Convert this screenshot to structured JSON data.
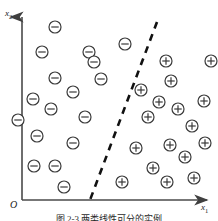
{
  "figure": {
    "caption": "图 2-3  两类线性可分的实例",
    "origin_label": "O",
    "axes": {
      "y_label_base": "x",
      "y_label_sub": "2",
      "x_label_base": "x",
      "x_label_sub": "1",
      "x_axis_color": "#4a4a4a",
      "y_axis_color": "#4a4a4a"
    },
    "colors": {
      "marker_stroke": "#3a3a3a",
      "boundary": "#111111",
      "background": "#ffffff"
    }
  },
  "chart_data": {
    "type": "scatter",
    "title": "图 2-3  两类线性可分的实例",
    "xlabel": "x1",
    "ylabel": "x2",
    "xlim": [
      0,
      218
    ],
    "ylim": [
      0,
      221
    ],
    "grid": false,
    "legend": null,
    "marker_radius": 6,
    "series": [
      {
        "name": "negative-class",
        "symbol": "minus-circle",
        "glyph": "⊖",
        "count": 17,
        "points": [
          {
            "x": 55,
            "y": 27
          },
          {
            "x": 42,
            "y": 52
          },
          {
            "x": 89,
            "y": 52
          },
          {
            "x": 125,
            "y": 44
          },
          {
            "x": 55,
            "y": 78
          },
          {
            "x": 101,
            "y": 79
          },
          {
            "x": 73,
            "y": 92
          },
          {
            "x": 33,
            "y": 99
          },
          {
            "x": 51,
            "y": 109
          },
          {
            "x": 85,
            "y": 117
          },
          {
            "x": 37,
            "y": 136
          },
          {
            "x": 73,
            "y": 143
          },
          {
            "x": 34,
            "y": 166
          },
          {
            "x": 55,
            "y": 166
          },
          {
            "x": 64,
            "y": 187
          },
          {
            "x": 18,
            "y": 120
          },
          {
            "x": 94,
            "y": 62
          }
        ]
      },
      {
        "name": "positive-class",
        "symbol": "plus-circle",
        "glyph": "⊕",
        "count": 21,
        "points": [
          {
            "x": 166,
            "y": 61
          },
          {
            "x": 171,
            "y": 81
          },
          {
            "x": 159,
            "y": 102
          },
          {
            "x": 178,
            "y": 109
          },
          {
            "x": 204,
            "y": 101
          },
          {
            "x": 148,
            "y": 117
          },
          {
            "x": 192,
            "y": 126
          },
          {
            "x": 136,
            "y": 148
          },
          {
            "x": 170,
            "y": 145
          },
          {
            "x": 205,
            "y": 143
          },
          {
            "x": 185,
            "y": 157
          },
          {
            "x": 153,
            "y": 168
          },
          {
            "x": 122,
            "y": 182
          },
          {
            "x": 167,
            "y": 182
          },
          {
            "x": 194,
            "y": 178
          },
          {
            "x": 211,
            "y": 61
          },
          {
            "x": 141,
            "y": 90
          }
        ]
      }
    ],
    "decision_boundary": {
      "name": "separating-hyperplane",
      "style": "dashed",
      "x1": 157,
      "y1": 22,
      "x2": 90,
      "y2": 200,
      "stroke_width": 2.6,
      "dash_pattern": "7 6"
    }
  }
}
